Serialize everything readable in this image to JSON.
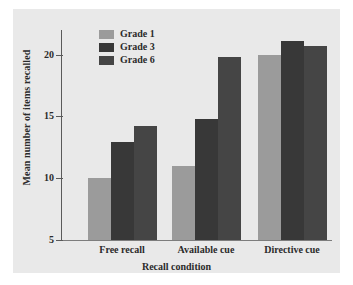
{
  "chart_data": {
    "type": "bar",
    "title": "",
    "xlabel": "Recall condition",
    "ylabel": "Mean number of items recalled",
    "categories": [
      "Free recall",
      "Available cue",
      "Directive cue"
    ],
    "series": [
      {
        "name": "Grade 1",
        "color": "#9b9b9b",
        "values": [
          10.0,
          11.0,
          20.0
        ]
      },
      {
        "name": "Grade 3",
        "color": "#383838",
        "values": [
          12.9,
          14.8,
          21.1
        ]
      },
      {
        "name": "Grade 6",
        "color": "#454545",
        "values": [
          14.2,
          19.8,
          20.7
        ]
      }
    ],
    "ylim": [
      5,
      22
    ],
    "yticks": [
      5,
      10,
      15,
      20
    ],
    "ytick_labels": [
      "5",
      "10",
      "15",
      "20"
    ],
    "grid": false,
    "legend_position": "top-left-inside"
  },
  "legend": {
    "items": [
      {
        "label": "Grade 1"
      },
      {
        "label": "Grade 3"
      },
      {
        "label": "Grade 6"
      }
    ]
  },
  "axes": {
    "y_title": "Mean number of items recalled",
    "x_title": "Recall condition",
    "y_tick_labels": [
      "20",
      "15",
      "10",
      "5"
    ],
    "x_tick_labels": [
      "Free recall",
      "Available cue",
      "Directive cue"
    ]
  },
  "colors": {
    "panel_background": "#e9e9e9",
    "page_background": "#ffffff",
    "axis": "#5a5a5a",
    "text": "#2b2b2b"
  }
}
